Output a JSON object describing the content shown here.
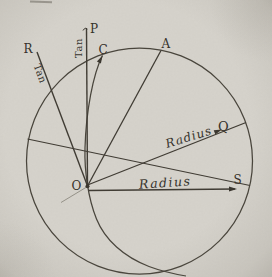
{
  "figure": {
    "paper_color": "#d6d3cc",
    "ink_color": "#3d3a33",
    "point_labels": {
      "O": "O",
      "P": "P",
      "R": "R",
      "C": "C",
      "A": "A",
      "Q": "Q",
      "S": "S"
    },
    "annotations": {
      "tan_vertical": "Tan",
      "tan_oblique": "Tan",
      "radius_upper": "Radius",
      "radius_lower": "Radius"
    }
  }
}
